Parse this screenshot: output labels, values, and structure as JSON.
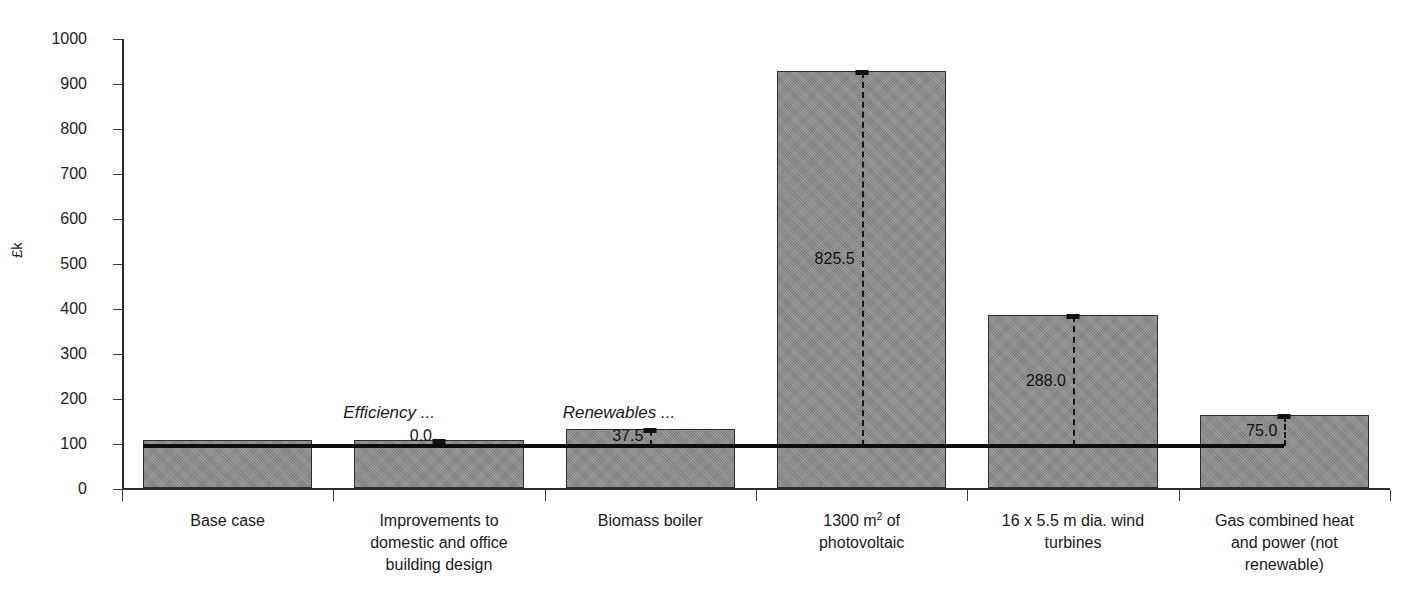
{
  "chart_data": {
    "type": "bar",
    "title": "",
    "subtitle": "",
    "xlabel": "",
    "ylabel": "£k",
    "ylim": [
      0,
      1000
    ],
    "ytick_step": 100,
    "yticks": [
      "1000",
      "900",
      "800",
      "700",
      "600",
      "500",
      "400",
      "300",
      "200",
      "100",
      "0"
    ],
    "grid": false,
    "legend": "none",
    "categories": [
      "Base case",
      "Improvements to domestic and office building design",
      "Biomass boiler",
      "1300 m2 of photovoltaic",
      "16 x 5.5 m dia. wind turbines",
      "Gas combined heat and power (not renewable)"
    ],
    "values": [
      106,
      106,
      131,
      927,
      384,
      162
    ],
    "increment_labels": [
      "",
      "0.0",
      "37.5",
      "825.5",
      "288.0",
      "75.0"
    ],
    "reference_line_value": 96,
    "bar_color": "#8b8b8b",
    "bar_edge_color": "#2d2d2d",
    "line_color": "#0d0d0d",
    "annotations": [
      {
        "text": "Efficiency ...",
        "style": "italic"
      },
      {
        "text": "Renewables ...",
        "style": "italic"
      }
    ]
  },
  "axis": {
    "ylabel": "£k",
    "ticks": [
      {
        "label": "1000",
        "value": 1000
      },
      {
        "label": "900",
        "value": 900
      },
      {
        "label": "800",
        "value": 800
      },
      {
        "label": "700",
        "value": 700
      },
      {
        "label": "600",
        "value": 600
      },
      {
        "label": "500",
        "value": 500
      },
      {
        "label": "400",
        "value": 400
      },
      {
        "label": "300",
        "value": 300
      },
      {
        "label": "200",
        "value": 200
      },
      {
        "label": "100",
        "value": 100
      },
      {
        "label": "0",
        "value": 0
      }
    ]
  },
  "categories": [
    {
      "lines": [
        "Base case"
      ],
      "value": 106,
      "increment": ""
    },
    {
      "lines": [
        "Improvements to",
        "domestic and office",
        "building design"
      ],
      "value": 106,
      "increment": "0.0"
    },
    {
      "lines": [
        "Biomass boiler"
      ],
      "value": 131,
      "increment": "37.5"
    },
    {
      "lines": [
        "1300 m",
        "photovoltaic"
      ],
      "sup": "2",
      "suffix": " of",
      "value": 927,
      "increment": "825.5"
    },
    {
      "lines": [
        "16 x 5.5 m dia. wind",
        "turbines"
      ],
      "value": 384,
      "increment": "288.0"
    },
    {
      "lines": [
        "Gas combined heat",
        "and power (not",
        "renewable)"
      ],
      "value": 162,
      "increment": "75.0"
    }
  ],
  "annotations": {
    "efficiency": "Efficiency ...",
    "renewables": "Renewables ..."
  }
}
